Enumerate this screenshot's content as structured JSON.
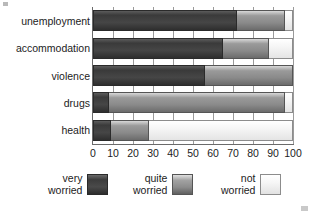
{
  "chart_data": {
    "type": "bar",
    "orientation": "horizontal",
    "stacked": true,
    "title": "",
    "xlabel": "",
    "ylabel": "",
    "xlim": [
      0,
      100
    ],
    "grid": true,
    "legend_position": "bottom",
    "categories": [
      "unemployment",
      "accommodation",
      "violence",
      "drugs",
      "health"
    ],
    "xticks": [
      0,
      10,
      20,
      30,
      40,
      50,
      60,
      70,
      80,
      90,
      100
    ],
    "series": [
      {
        "name": "very worried",
        "color": "#3d3d3d",
        "values": [
          72,
          65,
          56,
          8,
          9
        ]
      },
      {
        "name": "quite worried",
        "color": "#8c8c8c",
        "values": [
          24,
          23,
          44,
          88,
          19
        ]
      },
      {
        "name": "not worried",
        "color": "#f2f2f2",
        "values": [
          4,
          12,
          0,
          4,
          72
        ]
      }
    ]
  },
  "legend": {
    "items": [
      {
        "line1": "very",
        "line2": "worried",
        "swatch": "very-worried-swatch"
      },
      {
        "line1": "quite",
        "line2": "worried",
        "swatch": "quite-worried-swatch"
      },
      {
        "line1": "not",
        "line2": "worried",
        "swatch": "not-worried-swatch"
      }
    ]
  },
  "axis": {
    "tick_labels": [
      "0",
      "10",
      "20",
      "30",
      "40",
      "50",
      "60",
      "70",
      "80",
      "90",
      "100"
    ]
  }
}
